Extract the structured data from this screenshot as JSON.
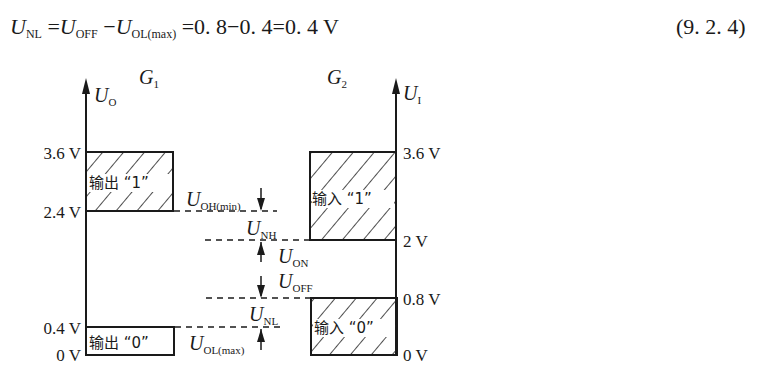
{
  "equation": {
    "lhs_symbol": "U",
    "lhs_sub": "NL",
    "eq1": "=",
    "term1_symbol": "U",
    "term1_sub": "OFF",
    "minus": "−",
    "term2_symbol": "U",
    "term2_sub": "OL(max)",
    "rest": "=0. 8−0. 4=0. 4 V",
    "number": "(9. 2. 4)"
  },
  "diagram": {
    "left_gate": {
      "name": "G",
      "name_sub": "1",
      "axis_symbol": "U",
      "axis_sub": "O",
      "ticks": [
        "3.6 V",
        "2.4 V",
        "0.4 V",
        "0 V"
      ],
      "box_high_label": "输出 “1”",
      "box_low_label": "输出 “0”"
    },
    "right_gate": {
      "name": "G",
      "name_sub": "2",
      "axis_symbol": "U",
      "axis_sub": "I",
      "ticks": [
        "3.6 V",
        "2 V",
        "0.8 V",
        "0 V"
      ],
      "box_high_label": "输入 “1”",
      "box_low_label": "输入 “0”"
    },
    "margins": [
      {
        "symbol": "U",
        "sub": "OH(min)"
      },
      {
        "symbol": "U",
        "sub": "NH"
      },
      {
        "symbol": "U",
        "sub": "ON"
      },
      {
        "symbol": "U",
        "sub": "OFF"
      },
      {
        "symbol": "U",
        "sub": "NL"
      },
      {
        "symbol": "U",
        "sub": "OL(max)"
      }
    ]
  }
}
